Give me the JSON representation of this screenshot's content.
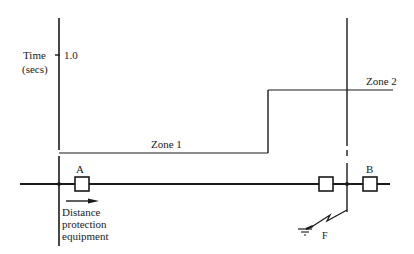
{
  "diagram": {
    "type": "distance protection time-distance characteristic",
    "axis": {
      "label_line1": "Time",
      "label_line2": "(secs)",
      "tick_value": "1.0"
    },
    "zones": [
      {
        "name": "Zone 1",
        "label": "Zone 1"
      },
      {
        "name": "Zone 2",
        "label": "Zone 2"
      }
    ],
    "relays": [
      {
        "id": "A",
        "label": "A"
      },
      {
        "id": "B",
        "label": "B"
      }
    ],
    "equipment_label": [
      "Distance",
      "protection",
      "equipment"
    ],
    "fault_label": "F",
    "colors": {
      "line": "#1a1a1a",
      "background": "#ffffff"
    }
  }
}
